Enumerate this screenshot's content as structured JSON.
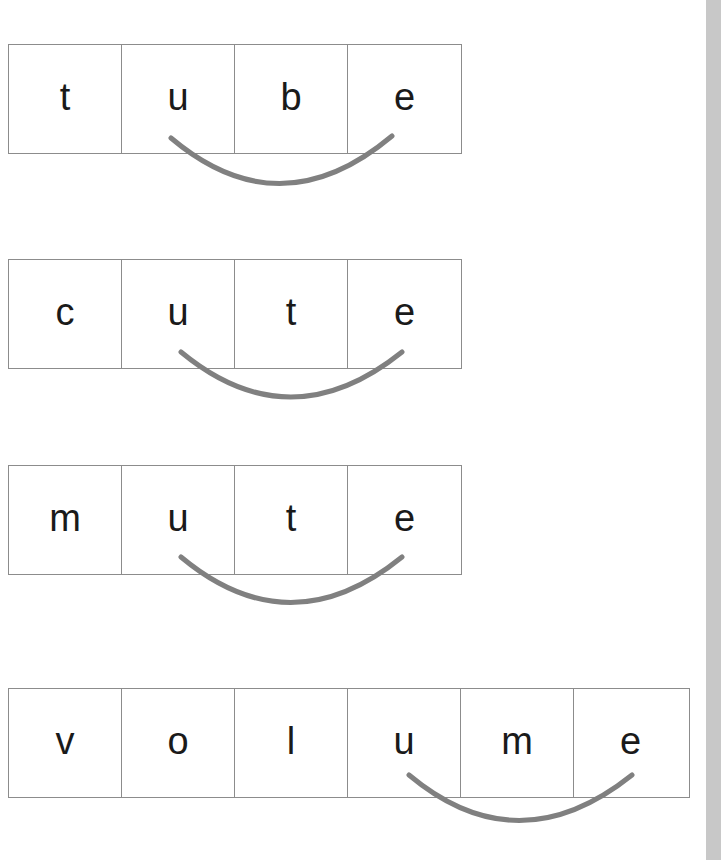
{
  "worksheet": {
    "words": [
      {
        "letters": [
          "t",
          "u",
          "b",
          "e"
        ],
        "arc_from": 1,
        "arc_to": 3
      },
      {
        "letters": [
          "c",
          "u",
          "t",
          "e"
        ],
        "arc_from": 1,
        "arc_to": 3
      },
      {
        "letters": [
          "m",
          "u",
          "t",
          "e"
        ],
        "arc_from": 1,
        "arc_to": 3
      },
      {
        "letters": [
          "v",
          "o",
          "l",
          "u",
          "m",
          "e"
        ],
        "arc_from": 3,
        "arc_to": 5
      }
    ],
    "colors": {
      "arc": "#808080",
      "border": "#8c8c8c",
      "text": "#1a1a1a",
      "side_strip": "#c8c8c8"
    }
  }
}
